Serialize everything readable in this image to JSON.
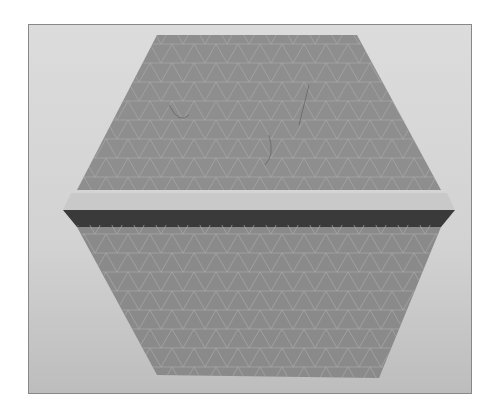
{
  "image": {
    "description": "Grayscale photograph of a folded paper hexagon with a triangular crease grid and a horizontal pleat across the middle",
    "colors": {
      "background": "#d6d6d6",
      "paper": "#8f8f8f",
      "pleat_light": "#c8c8c8",
      "pleat_dark": "#3a3a3a",
      "grid_lines": "#a8a8a8"
    }
  }
}
